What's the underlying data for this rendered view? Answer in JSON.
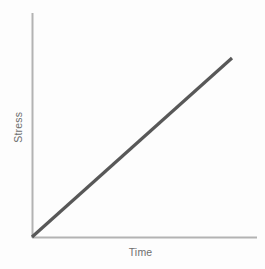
{
  "figure": {
    "name": "stress-vs-time-plot",
    "background_color": "#fdfdfd",
    "axis_color": "#b3b3b3",
    "line_color": "#585858",
    "label_color": "#6e6e6e"
  },
  "axes": {
    "y_title": "Stress",
    "x_title": "Time"
  },
  "chart_data": {
    "type": "line",
    "title": "",
    "xlabel": "Time",
    "ylabel": "Stress",
    "xlim": [
      0,
      1
    ],
    "ylim": [
      0,
      1
    ],
    "grid": false,
    "legend": null,
    "tick_labels": {
      "x": [],
      "y": []
    },
    "series": [
      {
        "name": "Stress",
        "color": "#585858",
        "line_width": 3,
        "x": [
          0.0,
          0.25,
          0.5,
          0.75,
          0.89
        ],
        "y": [
          0.0,
          0.224,
          0.447,
          0.671,
          0.796
        ],
        "description": "Straight line of constant positive slope rising from the origin; stress increases linearly with time."
      }
    ],
    "pixel_geometry": {
      "origin": [
        32,
        237
      ],
      "y_axis_top": [
        32,
        13
      ],
      "x_axis_right": [
        257,
        237
      ],
      "line_start": [
        32,
        237
      ],
      "line_end": [
        232,
        58
      ]
    }
  }
}
